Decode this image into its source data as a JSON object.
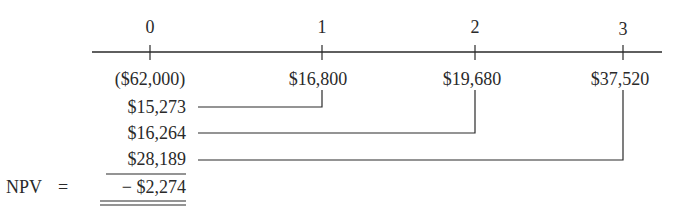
{
  "timeline": {
    "periods": [
      "0",
      "1",
      "2",
      "3"
    ],
    "cash_flows": [
      "($62,000)",
      "$16,800",
      "$19,680",
      "$37,520"
    ]
  },
  "present_values": [
    "$15,273",
    "$16,264",
    "$28,189"
  ],
  "npv": {
    "label": "NPV",
    "equals": "=",
    "value": "− $2,274"
  },
  "colors": {
    "ink": "#2a2a2a",
    "background": "#ffffff"
  }
}
